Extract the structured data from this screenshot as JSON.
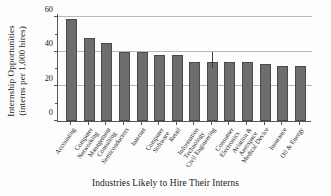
{
  "chart_data": {
    "type": "bar",
    "title": "",
    "xlabel": "Industries Likely to Hire Their Interns",
    "ylabel_line1": "Internship Opportunities",
    "ylabel_line2": "(interns per 1,000 hires)",
    "ylim": [
      0,
      62
    ],
    "yticks": [
      0,
      20,
      40,
      60
    ],
    "ytick_labels": [
      "0",
      "20",
      "40",
      "60"
    ],
    "yminorticks": [
      10,
      30,
      50
    ],
    "grid": "horizontal",
    "legend": null,
    "bar_color": "#6d6d6d",
    "bar_edge_color": "#4a4a4a",
    "categories": [
      "Accounting",
      "Computer Networking",
      "Management Consulting",
      "Semiconductors",
      "Internet",
      "Computer Software",
      "Retail",
      "Information Technology",
      "Civil Engineering",
      "Consumer Electronics",
      "Aviation & Aerospace",
      "Medical Device",
      "Insurance",
      "Oil & Energy"
    ],
    "category_lines": [
      [
        "Accounting"
      ],
      [
        "Computer",
        "Networking"
      ],
      [
        "Management",
        "Consulting"
      ],
      [
        "Semiconductors"
      ],
      [
        "Internet"
      ],
      [
        "Computer",
        "Software"
      ],
      [
        "Retail"
      ],
      [
        "Information",
        "Technology"
      ],
      [
        "Civil Engineering"
      ],
      [
        "Consumer",
        "Electronics"
      ],
      [
        "Aviation &",
        "Aerospace"
      ],
      [
        "Medical Device"
      ],
      [
        "Insurance"
      ],
      [
        "Oil & Energy"
      ]
    ],
    "values": [
      59,
      48,
      45,
      40,
      40,
      38,
      38,
      34,
      34,
      34,
      34,
      33,
      32,
      32
    ],
    "error_bars": [
      null,
      null,
      null,
      null,
      null,
      null,
      null,
      null,
      {
        "index": 8,
        "low": 31,
        "high": 40
      },
      null,
      null,
      null,
      null,
      null
    ]
  }
}
